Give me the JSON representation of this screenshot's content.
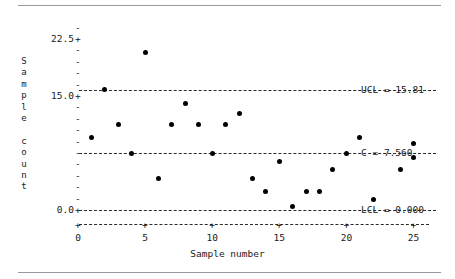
{
  "chart_data": {
    "type": "scatter",
    "title": "",
    "subtitle": "",
    "xlabel": "Sample number",
    "ylabel": "Sample count",
    "ylabel_chars": [
      "S",
      "a",
      "m",
      "p",
      "l",
      "e",
      "",
      "c",
      "o",
      "u",
      "n",
      "t"
    ],
    "xlim": [
      0,
      26
    ],
    "ylim": [
      0,
      24.5
    ],
    "grid": false,
    "legend": "none",
    "x_ticks": [
      0,
      5,
      10,
      15,
      20,
      25
    ],
    "x_tick_labels": [
      "0",
      "5",
      "10",
      "15",
      "20",
      "25"
    ],
    "y_ticks": [
      0.0,
      15.0,
      22.5
    ],
    "y_tick_labels": [
      "0.0",
      "15.0",
      "22.5"
    ],
    "y_minor_tick_values": [
      1.5,
      3.0,
      4.5,
      6.0,
      7.5,
      9.0,
      10.5,
      12.0,
      13.5,
      16.5,
      18.0,
      19.5,
      21.0,
      24.0
    ],
    "control_lines": [
      {
        "name": "UCL",
        "label": "UCL = 15.81",
        "value": 15.81,
        "style": "dashed"
      },
      {
        "name": "C",
        "label": "C = 7.560",
        "value": 7.56,
        "style": "dashed"
      },
      {
        "name": "LCL",
        "label": "LCL = 0.000",
        "value": 0.0,
        "style": "dashed"
      }
    ],
    "series": [
      {
        "name": "Sample count",
        "marker": "filled-circle",
        "color": "#000000",
        "points": [
          {
            "x": 1,
            "y": 9.5
          },
          {
            "x": 2,
            "y": 15.8
          },
          {
            "x": 3,
            "y": 11.3
          },
          {
            "x": 4,
            "y": 7.5
          },
          {
            "x": 5,
            "y": 20.7
          },
          {
            "x": 6,
            "y": 4.2
          },
          {
            "x": 7,
            "y": 11.3
          },
          {
            "x": 8,
            "y": 14.0
          },
          {
            "x": 9,
            "y": 11.3
          },
          {
            "x": 10,
            "y": 7.5
          },
          {
            "x": 11,
            "y": 11.3
          },
          {
            "x": 12,
            "y": 12.7
          },
          {
            "x": 13,
            "y": 4.2
          },
          {
            "x": 14,
            "y": 2.5
          },
          {
            "x": 15,
            "y": 6.4
          },
          {
            "x": 16,
            "y": 0.5
          },
          {
            "x": 17,
            "y": 2.5
          },
          {
            "x": 18,
            "y": 2.5
          },
          {
            "x": 19,
            "y": 5.3
          },
          {
            "x": 20,
            "y": 7.5
          },
          {
            "x": 21,
            "y": 9.5
          },
          {
            "x": 22,
            "y": 1.4
          },
          {
            "x": 24,
            "y": 5.3
          },
          {
            "x": 25,
            "y": 8.8
          },
          {
            "x": 25,
            "y": 6.9
          }
        ]
      }
    ]
  },
  "axis": {
    "y_plus_glyph": "+",
    "y_minus_glyph": "-",
    "x_plus_glyph": "+"
  },
  "colors": {
    "ink": "#1a1a1a",
    "rule": "#9a9a9a",
    "marker": "#000000",
    "limit_line": "#2a2a2a",
    "background": "#ffffff"
  }
}
